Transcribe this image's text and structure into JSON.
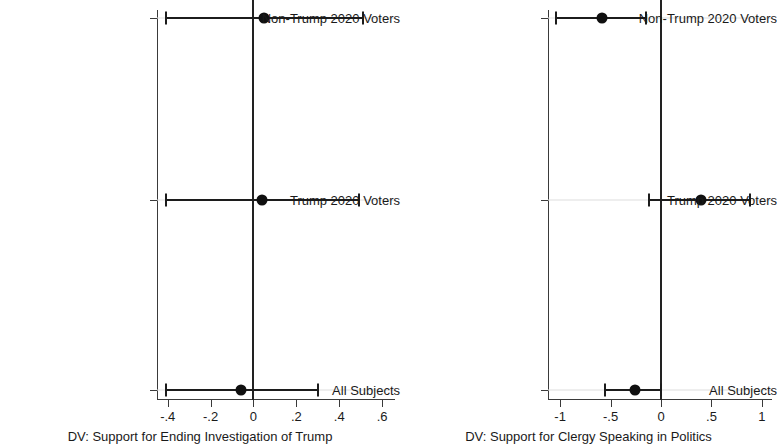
{
  "chart_data": [
    {
      "type": "scatter",
      "panel": "left",
      "title": "",
      "xlabel": "DV: Support for Ending Investigation of Trump",
      "ylabel": "",
      "xlim": [
        -0.45,
        0.66
      ],
      "xticks": [
        -0.4,
        -0.2,
        0,
        0.2,
        0.4,
        0.6
      ],
      "xticklabels": [
        "-.4",
        "-.2",
        "0",
        ".2",
        ".4",
        ".6"
      ],
      "categories": [
        "All Subjects",
        "Trump 2020 Voters",
        "Non-Trump 2020 Voters"
      ],
      "reference_line": 0,
      "grid": "horizontal",
      "points": [
        {
          "category": "Non-Trump 2020 Voters",
          "estimate": 0.05,
          "ci_low": -0.41,
          "ci_high": 0.51
        },
        {
          "category": "Trump 2020 Voters",
          "estimate": 0.04,
          "ci_low": -0.41,
          "ci_high": 0.49
        },
        {
          "category": "All Subjects",
          "estimate": -0.06,
          "ci_low": -0.41,
          "ci_high": 0.3
        }
      ]
    },
    {
      "type": "scatter",
      "panel": "right",
      "title": "",
      "xlabel": "DV: Support for Clergy Speaking in Politics",
      "ylabel": "",
      "xlim": [
        -1.12,
        1.1
      ],
      "xticks": [
        -1,
        -0.5,
        0,
        0.5,
        1
      ],
      "xticklabels": [
        "-1",
        "-.5",
        "0",
        ".5",
        "1"
      ],
      "categories": [
        "All Subjects",
        "Trump 2020 Voters",
        "Non-Trump 2020 Voters"
      ],
      "reference_line": 0,
      "grid": "horizontal",
      "points": [
        {
          "category": "Non-Trump 2020 Voters",
          "estimate": -0.58,
          "ci_low": -1.04,
          "ci_high": -0.15
        },
        {
          "category": "Trump 2020 Voters",
          "estimate": 0.4,
          "ci_low": -0.12,
          "ci_high": 0.88
        },
        {
          "category": "All Subjects",
          "estimate": -0.26,
          "ci_low": -0.56,
          "ci_high": 0.0
        }
      ]
    }
  ]
}
